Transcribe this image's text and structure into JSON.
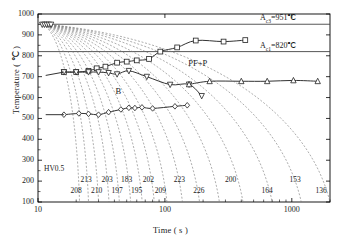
{
  "chart_data": {
    "type": "line",
    "title": "",
    "xlabel": "Time ( s )",
    "ylabel": "Temperature ( °C )",
    "xscale": "log",
    "xlim": [
      10,
      2000
    ],
    "ylim": [
      100,
      1000
    ],
    "xticks": [
      {
        "value": 10,
        "label": "10"
      },
      {
        "value": 100,
        "label": "100"
      },
      {
        "value": 1000,
        "label": "1000"
      }
    ],
    "yticks": [
      {
        "value": 100,
        "label": "100"
      },
      {
        "value": 200,
        "label": "200"
      },
      {
        "value": 300,
        "label": "300"
      },
      {
        "value": 400,
        "label": "400"
      },
      {
        "value": 500,
        "label": "500"
      },
      {
        "value": 600,
        "label": "600"
      },
      {
        "value": 700,
        "label": "700"
      },
      {
        "value": 800,
        "label": "800"
      },
      {
        "value": 900,
        "label": "900"
      },
      {
        "value": 1000,
        "label": "1000"
      }
    ],
    "grid": false,
    "legend": "none",
    "reference_lines": [
      {
        "name": "Ac3",
        "label": "Aᴄ₃=951℃",
        "label_text": "=951℃",
        "sub": "c3",
        "prefix": "A",
        "value": 951
      },
      {
        "name": "Ac1",
        "label": "Aᴄ₁=820℃",
        "label_text": "=820℃",
        "sub": "c1",
        "prefix": "A",
        "value": 820
      }
    ],
    "phase_labels": [
      {
        "text": "PF+P",
        "x": 180,
        "y": 760
      },
      {
        "text": "B",
        "x": 48,
        "y": 627
      }
    ],
    "hardness_label": "HV0.5",
    "hardness_values": [
      {
        "value": "208",
        "x": 20
      },
      {
        "value": "213",
        "x": 24
      },
      {
        "value": "210",
        "x": 29
      },
      {
        "value": "203",
        "x": 35
      },
      {
        "value": "197",
        "x": 42
      },
      {
        "value": "183",
        "x": 50
      },
      {
        "value": "195",
        "x": 60
      },
      {
        "value": "202",
        "x": 74
      },
      {
        "value": "209",
        "x": 92
      },
      {
        "value": "223",
        "x": 130
      },
      {
        "value": "226",
        "x": 185
      },
      {
        "value": "200",
        "x": 330
      },
      {
        "value": "164",
        "x": 640
      },
      {
        "value": "153",
        "x": 1060
      },
      {
        "value": "136",
        "x": 1700
      }
    ],
    "transformation_curves": [
      {
        "name": "ferrite-pearlite-start",
        "marker": "square",
        "points": [
          {
            "x": 16,
            "y": 722
          },
          {
            "x": 20,
            "y": 722
          },
          {
            "x": 25,
            "y": 728
          },
          {
            "x": 29,
            "y": 740
          },
          {
            "x": 34,
            "y": 748
          },
          {
            "x": 42,
            "y": 767
          },
          {
            "x": 50,
            "y": 772
          },
          {
            "x": 60,
            "y": 778
          },
          {
            "x": 75,
            "y": 785
          },
          {
            "x": 92,
            "y": 820
          },
          {
            "x": 125,
            "y": 840
          },
          {
            "x": 175,
            "y": 873
          },
          {
            "x": 290,
            "y": 868
          },
          {
            "x": 430,
            "y": 875
          }
        ]
      },
      {
        "name": "bainite-start",
        "marker": "down-triangle",
        "points": [
          {
            "x": 16,
            "y": 722
          },
          {
            "x": 20,
            "y": 722
          },
          {
            "x": 25,
            "y": 722
          },
          {
            "x": 30,
            "y": 722
          },
          {
            "x": 36,
            "y": 718
          },
          {
            "x": 42,
            "y": 712
          },
          {
            "x": 52,
            "y": 728
          },
          {
            "x": 72,
            "y": 700
          },
          {
            "x": 110,
            "y": 662
          },
          {
            "x": 155,
            "y": 663
          },
          {
            "x": 195,
            "y": 608
          }
        ]
      },
      {
        "name": "ferrite-pearlite-finish",
        "marker": "up-triangle",
        "points": [
          {
            "x": 155,
            "y": 663
          },
          {
            "x": 225,
            "y": 678
          },
          {
            "x": 400,
            "y": 678
          },
          {
            "x": 640,
            "y": 678
          },
          {
            "x": 1030,
            "y": 682
          },
          {
            "x": 1600,
            "y": 678
          }
        ]
      },
      {
        "name": "bainite-finish",
        "marker": "diamond",
        "points": [
          {
            "x": 16,
            "y": 518
          },
          {
            "x": 21,
            "y": 524
          },
          {
            "x": 25,
            "y": 522
          },
          {
            "x": 30,
            "y": 518
          },
          {
            "x": 36,
            "y": 530
          },
          {
            "x": 45,
            "y": 543
          },
          {
            "x": 52,
            "y": 551
          },
          {
            "x": 58,
            "y": 550
          },
          {
            "x": 66,
            "y": 553
          },
          {
            "x": 80,
            "y": 548
          },
          {
            "x": 120,
            "y": 558
          },
          {
            "x": 150,
            "y": 563
          }
        ]
      }
    ],
    "cooling_curves_count": 15,
    "cooling_curve_origin": {
      "x": 11,
      "y": 952
    }
  },
  "axes": {
    "x_axis_label": "Time ( s )",
    "y_axis_label": "Temperature ( ℃ )"
  },
  "colors": {
    "ink": "#1a1a1a",
    "curve": "#333333",
    "cooling": "#777777",
    "frame": "#000000"
  }
}
